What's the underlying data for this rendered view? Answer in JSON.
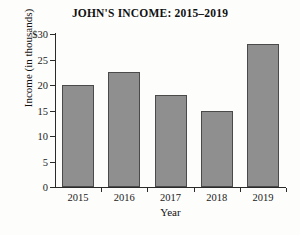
{
  "chart_data": {
    "type": "bar",
    "title": "JOHN'S INCOME: 2015–2019",
    "xlabel": "Year",
    "ylabel": "Income (in thousands)",
    "categories": [
      "2015",
      "2016",
      "2017",
      "2018",
      "2019"
    ],
    "values": [
      20,
      22.5,
      18,
      15,
      28
    ],
    "ylim": [
      0,
      30
    ],
    "ytick_values": [
      0,
      5,
      10,
      15,
      20,
      25,
      30
    ],
    "ytick_labels": [
      "0",
      "5",
      "10",
      "15",
      "20",
      "25",
      "$30"
    ],
    "grid": false,
    "legend": null,
    "series": [
      {
        "name": "Income",
        "values": [
          20,
          22.5,
          18,
          15,
          28
        ]
      }
    ],
    "bar_color": "#8f8f8f",
    "bar_edge_color": "#4a4a4a",
    "axis_color": "#2a2a2a",
    "background_color": "#fdfdfc"
  }
}
